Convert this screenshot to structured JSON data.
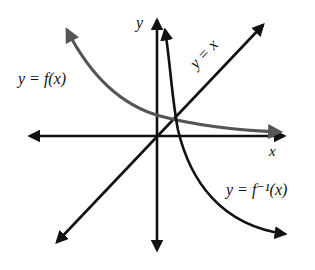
{
  "diagram": {
    "title": "",
    "axes": {
      "x_label": "x",
      "y_label": "y"
    },
    "curves": [
      {
        "id": "f",
        "label": "y = f(x)",
        "color": "#555555",
        "description": "decreasing curve, arrow up-left, approaching x-axis to the right"
      },
      {
        "id": "f_inverse",
        "label": "y = f⁻¹(x)",
        "color": "#111111",
        "description": "decreasing curve, arrow up near y-axis, descending to lower right"
      },
      {
        "id": "identity",
        "label": "y = x",
        "color": "#111111",
        "description": "line of symmetry through origin with arrows both ends"
      }
    ]
  },
  "colors": {
    "axis": "#111111",
    "f_curve": "#555555",
    "f_inverse_curve": "#111111",
    "background": "#ffffff"
  }
}
